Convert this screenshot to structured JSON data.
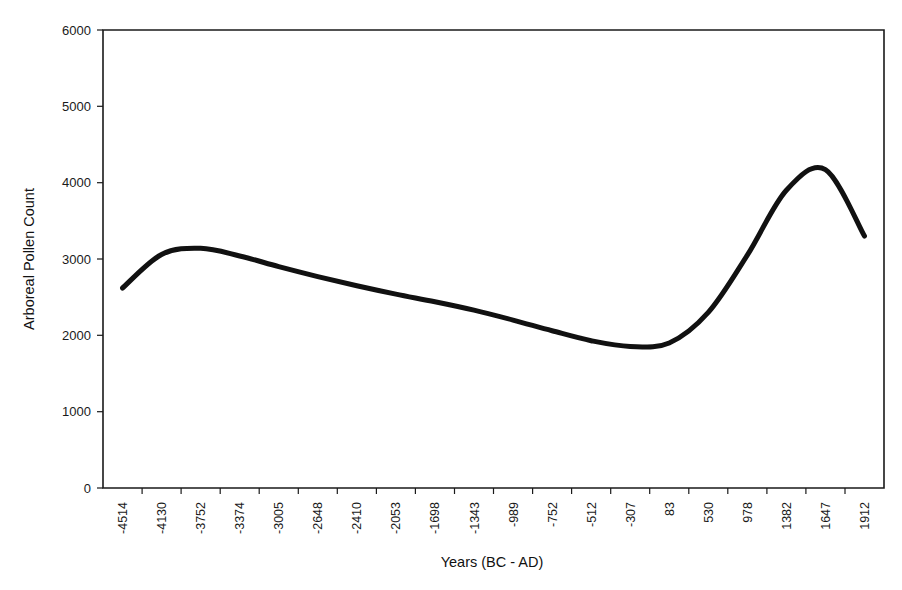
{
  "chart_data": {
    "type": "line",
    "title": "",
    "xlabel": "Years (BC - AD)",
    "ylabel": "Arboreal Pollen Count",
    "grid": false,
    "legend": "none",
    "ylim": [
      0,
      6000
    ],
    "y_ticks": [
      0,
      1000,
      2000,
      3000,
      4000,
      5000,
      6000
    ],
    "y_tick_labels": [
      "0",
      "1000",
      "2000",
      "3000",
      "4000",
      "5000",
      "6000"
    ],
    "categories": [
      "-4514",
      "-4130",
      "-3752",
      "-3374",
      "-3005",
      "-2648",
      "-2410",
      "-2053",
      "-1698",
      "-1343",
      "-989",
      "-752",
      "-512",
      "-307",
      "83",
      "530",
      "978",
      "1382",
      "1647",
      "1912"
    ],
    "series": [
      {
        "name": "Arboreal Pollen Count",
        "color": "#111111",
        "values": [
          2620,
          3060,
          3140,
          3040,
          2900,
          2770,
          2650,
          2540,
          2440,
          2330,
          2200,
          2060,
          1930,
          1855,
          1900,
          2300,
          3050,
          3900,
          4170,
          3300
        ]
      }
    ],
    "annotations": {
      "start_value": 2620,
      "first_peak_value": 3140,
      "trough_value": 1855,
      "max_value": 4170,
      "end_value": 2490
    }
  },
  "axes": {
    "y_axis_title": "Arboreal Pollen Count",
    "x_axis_title": "Years (BC - AD)"
  }
}
